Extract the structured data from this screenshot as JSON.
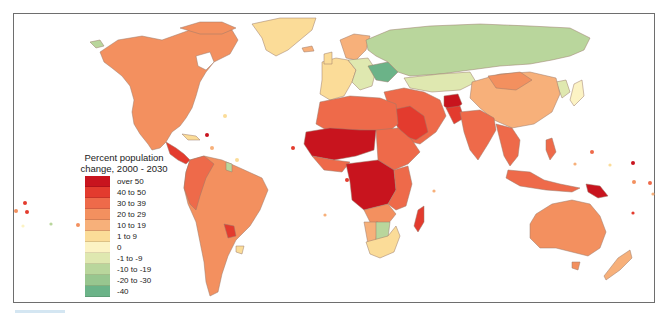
{
  "legend": {
    "title_line1": "Percent population",
    "title_line2": "change, 2000 - 2030",
    "items": [
      {
        "label": "over 50",
        "color": "#c8141e"
      },
      {
        "label": "40 to 50",
        "color": "#e33b2e"
      },
      {
        "label": "30 to 39",
        "color": "#ee6a4a"
      },
      {
        "label": "20 to 29",
        "color": "#f3905f"
      },
      {
        "label": "10 to 19",
        "color": "#f7b07a"
      },
      {
        "label": "1 to 9",
        "color": "#fbdc98"
      },
      {
        "label": "0",
        "color": "#fcf3c4"
      },
      {
        "label": "-1 to -9",
        "color": "#dfe8b0"
      },
      {
        "label": "-10 to -19",
        "color": "#b9d69c"
      },
      {
        "label": "-20 to -30",
        "color": "#98c68f"
      },
      {
        "label": "-40",
        "color": "#6bb388"
      }
    ]
  },
  "colors": {
    "frame_border": "#6e6e6e",
    "background": "#ffffff",
    "country_border": "#8a6a5a"
  }
}
